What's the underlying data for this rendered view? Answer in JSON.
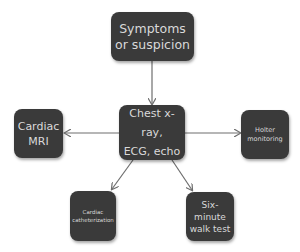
{
  "diagram": {
    "type": "flowchart",
    "colors": {
      "node_fill": "#3a3a3a",
      "node_text": "#d9d9d9",
      "connector": "#6e6e6e",
      "background": "#ffffff"
    },
    "nodes": {
      "symptoms": {
        "label": "Symptoms\nor suspicion"
      },
      "center": {
        "label": "Chest x-ray,\nECG, echo"
      },
      "mri": {
        "label": "Cardiac\nMRI"
      },
      "holter": {
        "label": "Holter\nmonitoring"
      },
      "cath": {
        "label": "Cardiac\ncatheterization"
      },
      "walk": {
        "label": "Six-\nminute\nwalk test"
      }
    },
    "edges": [
      {
        "from": "symptoms",
        "to": "center"
      },
      {
        "from": "center",
        "to": "mri"
      },
      {
        "from": "center",
        "to": "holter"
      },
      {
        "from": "center",
        "to": "cath"
      },
      {
        "from": "center",
        "to": "walk"
      }
    ]
  }
}
